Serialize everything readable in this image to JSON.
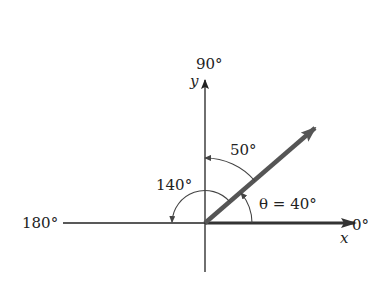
{
  "diagram": {
    "axes": {
      "x_label": "x",
      "y_label": "y",
      "label_0": "0°",
      "label_90": "90°",
      "label_180": "180°"
    },
    "angles": {
      "theta_label": "θ = 40°",
      "complement_label": "50°",
      "supplement_label": "140°"
    },
    "vector": {
      "angle_deg": 40,
      "color": "#555555"
    },
    "colors": {
      "axis": "#222222",
      "arc": "#444444",
      "vector": "#555555",
      "x_axis_overlay": "#333333"
    }
  }
}
